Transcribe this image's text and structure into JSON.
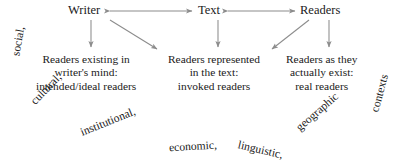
{
  "diagram": {
    "top_row": {
      "nodes": [
        {
          "id": "writer",
          "label": "Writer"
        },
        {
          "id": "text",
          "label": "Text"
        },
        {
          "id": "readers",
          "label": "Readers"
        }
      ],
      "connectors": [
        {
          "id": "writer-text-arrow",
          "kind": "double-headed-horizontal-arrow",
          "from": "writer",
          "to": "text"
        },
        {
          "id": "text-readers-arrow",
          "kind": "double-headed-horizontal-arrow",
          "from": "text",
          "to": "readers"
        }
      ]
    },
    "down_arrows": [
      {
        "id": "writer-to-writer-mind",
        "kind": "vertical-arrow",
        "from": "writer",
        "to": "block-writer-mind"
      },
      {
        "id": "writer-to-in-text",
        "kind": "diagonal-arrow-right",
        "from": "writer",
        "to": "block-in-text"
      },
      {
        "id": "text-to-in-text",
        "kind": "vertical-arrow",
        "from": "text",
        "to": "block-in-text"
      },
      {
        "id": "readers-to-in-text",
        "kind": "diagonal-arrow-left",
        "from": "readers",
        "to": "block-in-text"
      },
      {
        "id": "readers-to-real",
        "kind": "vertical-arrow",
        "from": "readers",
        "to": "block-real"
      }
    ],
    "blocks": [
      {
        "id": "block-writer-mind",
        "lines": [
          "Readers existing in",
          "writer's mind:",
          "intended/ideal readers"
        ]
      },
      {
        "id": "block-in-text",
        "lines": [
          "Readers represented",
          "in the text:",
          "invoked readers"
        ]
      },
      {
        "id": "block-real",
        "lines": [
          "Readers as they",
          "actually exist:",
          "real readers"
        ]
      }
    ],
    "context_arc": {
      "full_text": "social, cultural, institutional, economic, linguistic, geographic contexts",
      "words": [
        {
          "text": "social,",
          "x": 16,
          "y": 56,
          "rotate": -80
        },
        {
          "text": "cultural,",
          "x": 33,
          "y": 103,
          "rotate": -46
        },
        {
          "text": "institutional,",
          "x": 81,
          "y": 133,
          "rotate": -22
        },
        {
          "text": "economic,",
          "x": 169,
          "y": 148,
          "rotate": -3
        },
        {
          "text": "linguistic,",
          "x": 238,
          "y": 145,
          "rotate": 13
        },
        {
          "text": "geographic",
          "x": 298,
          "y": 129,
          "rotate": -41
        },
        {
          "text": "contexts",
          "x": 375,
          "y": 112,
          "rotate": -75
        }
      ]
    },
    "colors": {
      "background": "#ffffff",
      "text": "#1a1a1a",
      "arrow": "#8c8c8c"
    }
  }
}
